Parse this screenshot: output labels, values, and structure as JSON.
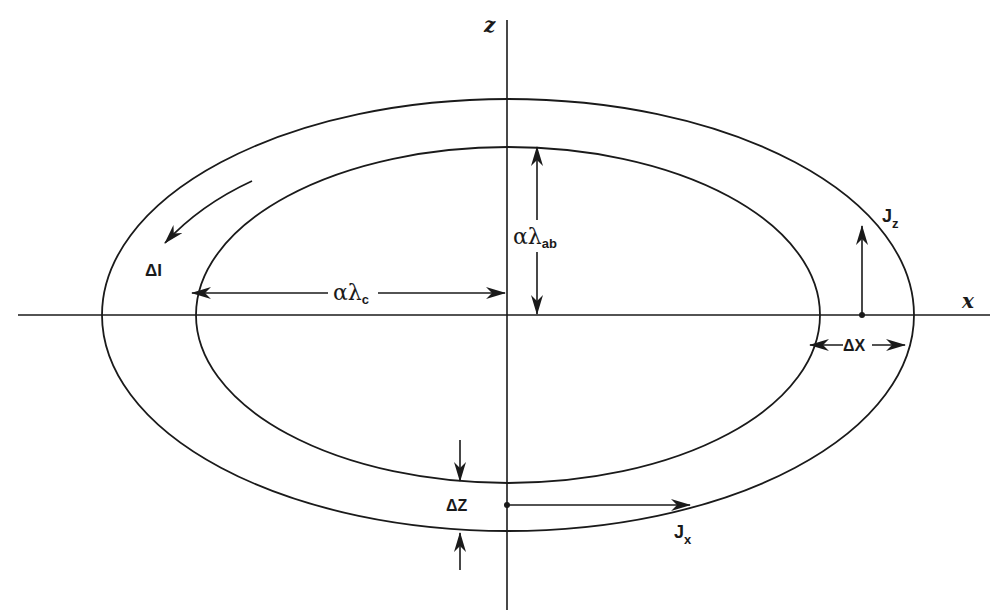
{
  "diagram": {
    "colors": {
      "stroke": "#1a1a1a",
      "background": "#ffffff"
    },
    "axes": {
      "x_label": "x",
      "z_label": "z"
    },
    "ellipses": {
      "outer": {
        "cx": 508,
        "cy": 315,
        "rx": 406,
        "ry": 216
      },
      "inner": {
        "cx": 508,
        "cy": 315,
        "rx": 312,
        "ry": 168
      }
    },
    "labels": {
      "delta_I": {
        "prefix": "Δ",
        "main": "I"
      },
      "alpha_lambda_c": {
        "main": "αλ",
        "sub": "c"
      },
      "alpha_lambda_ab": {
        "main": "αλ",
        "sub": "ab"
      },
      "J_z": {
        "main": "J",
        "sub": "z"
      },
      "J_x": {
        "main": "J",
        "sub": "x"
      },
      "delta_X": {
        "text": "ΔX"
      },
      "delta_Z": {
        "text": "ΔZ"
      }
    }
  }
}
